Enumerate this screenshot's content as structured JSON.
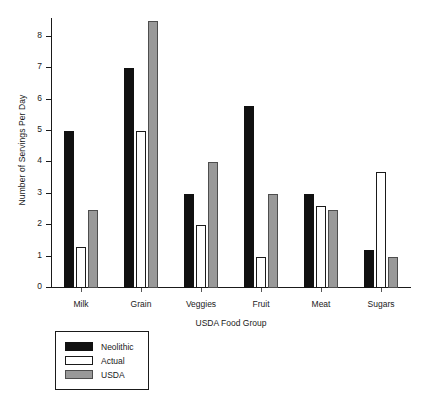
{
  "chart_data": {
    "type": "bar",
    "title": "",
    "xlabel": "USDA Food Group",
    "ylabel": "Number of Servings Per Day",
    "categories": [
      "Milk",
      "Grain",
      "Veggies",
      "Fruit",
      "Meat",
      "Sugars"
    ],
    "series": [
      {
        "name": "Neolithic",
        "color": "#111111",
        "values": [
          5,
          7,
          3,
          5.8,
          3,
          1.2
        ]
      },
      {
        "name": "Actual",
        "color": "#ffffff",
        "values": [
          1.3,
          5,
          2,
          1,
          2.6,
          3.7
        ]
      },
      {
        "name": "USDA",
        "color": "#999999",
        "values": [
          2.5,
          8.5,
          4,
          3,
          2.5,
          1
        ]
      }
    ],
    "ylim": [
      0,
      8.6
    ],
    "yticks": [
      0,
      1,
      2,
      3,
      4,
      5,
      6,
      7,
      8
    ],
    "ytick_labels": [
      "0",
      "1",
      "2",
      "3",
      "4",
      "5",
      "6",
      "7",
      "8"
    ],
    "grid": false,
    "legend_position": "below-left",
    "legend_entries": [
      "Neolithic",
      "Actual",
      "USDA"
    ]
  }
}
